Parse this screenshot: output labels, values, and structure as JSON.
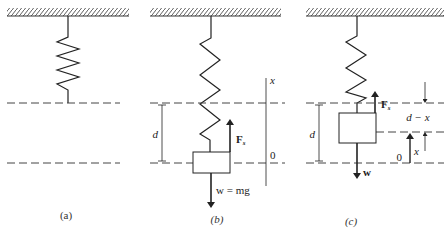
{
  "figure": {
    "panels": [
      {
        "id": "a",
        "caption": "(a)"
      },
      {
        "id": "b",
        "caption": "(b)",
        "labels": {
          "d": "d",
          "force_spring": "F",
          "force_spring_sub": "s",
          "weight": "w = mg",
          "axis_x": "x",
          "origin": "0"
        }
      },
      {
        "id": "c",
        "caption": "(c)",
        "labels": {
          "d": "d",
          "force_spring": "F",
          "force_spring_sub": "s",
          "weight": "w",
          "d_minus_x": "d − x",
          "x": "x",
          "origin": "0"
        }
      }
    ]
  },
  "colors": {
    "ink": "#222222",
    "dash": "#444444",
    "background": "#ffffff"
  }
}
